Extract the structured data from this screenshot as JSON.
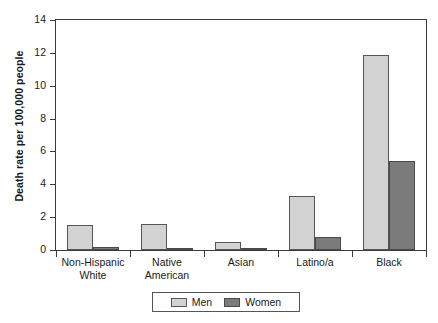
{
  "chart_data": {
    "type": "bar",
    "title": "",
    "xlabel": "",
    "ylabel": "Death rate per 100,000 people",
    "ylim": [
      0,
      14
    ],
    "ytick_step": 2,
    "yticks": [
      0,
      2,
      4,
      6,
      8,
      10,
      12,
      14
    ],
    "ytick_labels": [
      "0",
      "2",
      "4",
      "6",
      "8",
      "10",
      "12",
      "14"
    ],
    "grid": false,
    "legend_position": "bottom-center",
    "categories": [
      "Non-Hispanic White",
      "Native American",
      "Asian",
      "Latino/a",
      "Black"
    ],
    "category_lines": [
      [
        "Non-Hispanic",
        "White"
      ],
      [
        "Native",
        "American"
      ],
      [
        "Asian"
      ],
      [
        "Latino/a"
      ],
      [
        "Black"
      ]
    ],
    "series": [
      {
        "name": "Men",
        "color": "#d2d2d2",
        "values": [
          1.5,
          1.6,
          0.5,
          3.3,
          11.9
        ]
      },
      {
        "name": "Women",
        "color": "#7b7b7b",
        "values": [
          0.2,
          0.1,
          0.1,
          0.8,
          5.4
        ]
      }
    ]
  },
  "legend": {
    "items": [
      {
        "label": "Men",
        "color": "#d2d2d2"
      },
      {
        "label": "Women",
        "color": "#7b7b7b"
      }
    ]
  },
  "colors": {
    "men": "#d2d2d2",
    "women": "#7b7b7b",
    "axis": "#3a3a3a",
    "bar_border": "#565656",
    "background": "#ffffff"
  }
}
